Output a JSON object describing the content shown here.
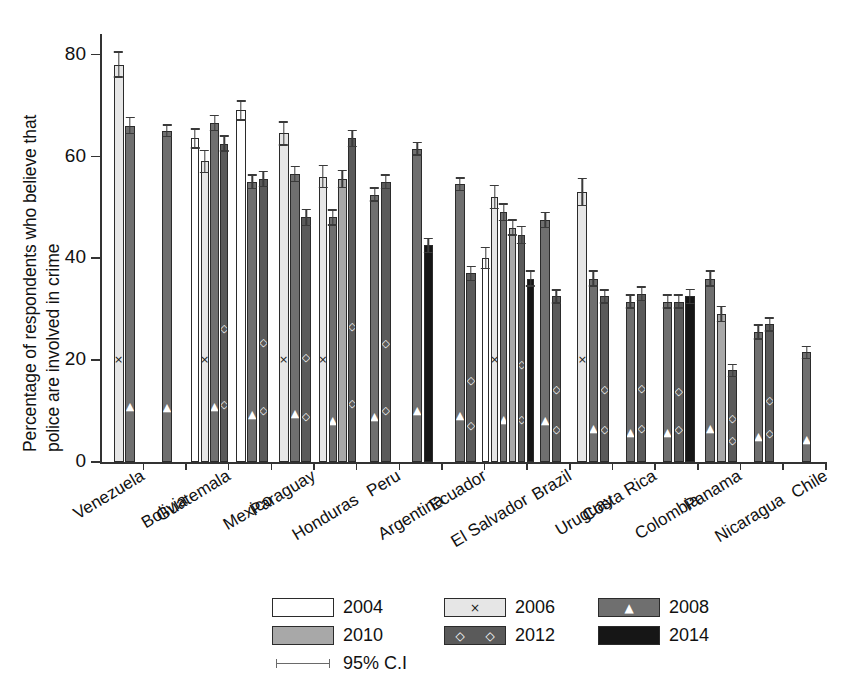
{
  "chart_data": {
    "type": "bar",
    "title": "",
    "subtitle": "",
    "xlabel": "",
    "ylabel": "Percentage of respondents who believe that police are involved in crime",
    "ylabel_line1": "Percentage of respondents who believe that",
    "ylabel_line2": "police are involved in crime",
    "ylim": [
      0,
      84
    ],
    "yticks": [
      0,
      20,
      40,
      60,
      80
    ],
    "ytick_labels": [
      "0",
      "20",
      "40",
      "60",
      "80"
    ],
    "grid": false,
    "legend_position": "bottom",
    "error_bars": "95% C.I",
    "categories": [
      "Venezuela",
      "Bolivia",
      "Guatemala",
      "Mexico",
      "Paraguay",
      "Honduras",
      "Peru",
      "Argentina",
      "Ecuador",
      "El Salvador",
      "Brazil",
      "Uruguay",
      "Costa Rica",
      "Colombia",
      "Panama",
      "Nicaragua",
      "Chile"
    ],
    "series": [
      {
        "name": "2004",
        "color": "#ffffff",
        "marker": "none",
        "values": [
          null,
          null,
          63.5,
          69.0,
          null,
          null,
          null,
          null,
          null,
          40.0,
          null,
          null,
          null,
          null,
          null,
          null,
          null
        ],
        "ci": [
          null,
          null,
          2.0,
          2.0,
          null,
          null,
          null,
          null,
          null,
          2.2,
          null,
          null,
          null,
          null,
          null,
          null,
          null
        ]
      },
      {
        "name": "2006",
        "color": "#e6e6e6",
        "marker": "x",
        "values": [
          78.0,
          null,
          59.0,
          null,
          64.5,
          56.0,
          null,
          null,
          null,
          52.0,
          null,
          53.0,
          null,
          null,
          null,
          null,
          null
        ],
        "ci": [
          2.6,
          null,
          2.3,
          null,
          2.4,
          2.3,
          null,
          null,
          null,
          2.4,
          null,
          2.8,
          null,
          null,
          null,
          null,
          null
        ]
      },
      {
        "name": "2008",
        "color": "#6f6f6f",
        "marker": "triangle",
        "values": [
          66.0,
          65.0,
          66.5,
          55.0,
          56.5,
          48.0,
          52.5,
          61.5,
          54.5,
          49.0,
          47.5,
          36.0,
          31.5,
          31.5,
          36.0,
          25.5,
          21.5
        ],
        "ci": [
          1.7,
          1.3,
          1.6,
          1.5,
          1.6,
          1.6,
          1.4,
          1.4,
          1.4,
          1.8,
          1.6,
          1.6,
          1.4,
          1.4,
          1.6,
          1.5,
          1.3
        ]
      },
      {
        "name": "2010",
        "color": "#a8a8a8",
        "marker": "none",
        "values": [
          null,
          null,
          null,
          null,
          null,
          55.5,
          null,
          null,
          null,
          46.0,
          null,
          null,
          null,
          null,
          29.0,
          null,
          null
        ],
        "ci": [
          null,
          null,
          null,
          null,
          null,
          1.8,
          null,
          null,
          null,
          1.6,
          null,
          null,
          null,
          null,
          1.6,
          null,
          null
        ]
      },
      {
        "name": "2012",
        "color": "#5a5a5a",
        "marker": "diamond",
        "values": [
          null,
          null,
          62.5,
          55.5,
          48.0,
          63.5,
          55.0,
          null,
          37.0,
          44.5,
          32.5,
          32.5,
          33.0,
          31.5,
          18.0,
          27.0,
          null
        ],
        "ci": [
          null,
          null,
          1.6,
          1.6,
          1.7,
          1.7,
          1.5,
          null,
          1.5,
          1.8,
          1.4,
          1.4,
          1.5,
          1.4,
          1.3,
          1.4,
          null
        ]
      },
      {
        "name": "2014",
        "color": "#161616",
        "marker": "none",
        "values": [
          null,
          null,
          null,
          null,
          null,
          null,
          null,
          42.5,
          null,
          36.0,
          null,
          null,
          null,
          32.5,
          null,
          null,
          null
        ],
        "ci": [
          null,
          null,
          null,
          null,
          null,
          null,
          null,
          1.5,
          null,
          1.6,
          null,
          null,
          null,
          1.5,
          null,
          null,
          null
        ]
      }
    ]
  },
  "legend": {
    "items": [
      {
        "label": "2004",
        "year": "2004",
        "marker": "none",
        "swatch_class": "y2004"
      },
      {
        "label": "2006",
        "year": "2006",
        "marker": "x",
        "swatch_class": "y2006"
      },
      {
        "label": "2008",
        "year": "2008",
        "marker": "triangle",
        "swatch_class": "y2008"
      },
      {
        "label": "2010",
        "year": "2010",
        "marker": "none",
        "swatch_class": "y2010"
      },
      {
        "label": "2012",
        "year": "2012",
        "marker": "diamond",
        "swatch_class": "y2012"
      },
      {
        "label": "2014",
        "year": "2014",
        "marker": "none",
        "swatch_class": "y2014"
      }
    ],
    "ci_label": "95% C.I"
  },
  "markers": {
    "x": "×",
    "triangle": "▲",
    "diamond": "◇",
    "none": ""
  }
}
